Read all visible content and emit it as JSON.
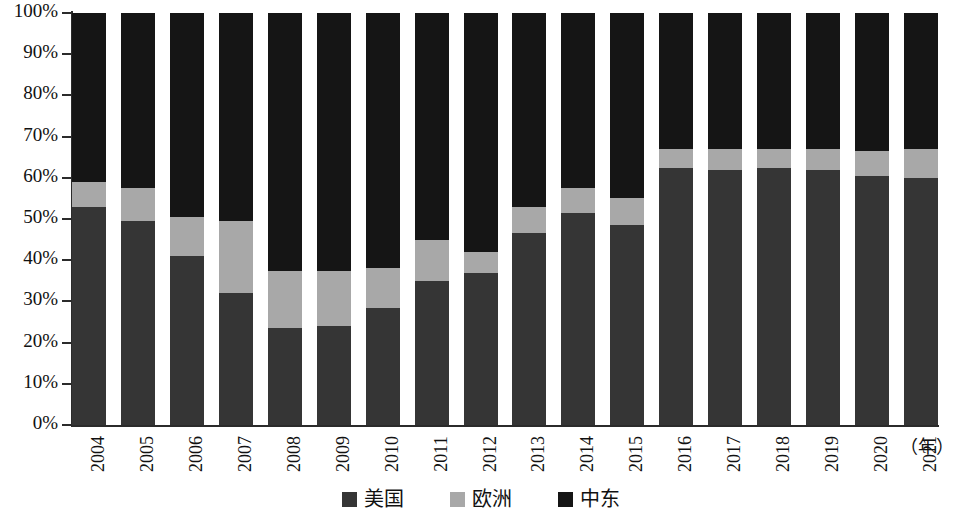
{
  "chart_data": {
    "type": "bar",
    "subtype": "stacked-100-percent",
    "title": "",
    "xlabel": "（年）",
    "ylabel": "",
    "ylim": [
      0,
      100
    ],
    "ytick_labels": [
      "100%",
      "90%",
      "80%",
      "70%",
      "60%",
      "50%",
      "40%",
      "30%",
      "20%",
      "10%",
      "0%"
    ],
    "ytick_values": [
      100,
      90,
      80,
      70,
      60,
      50,
      40,
      30,
      20,
      10,
      0
    ],
    "grid": false,
    "legend_position": "bottom-center",
    "categories": [
      "2004",
      "2005",
      "2006",
      "2007",
      "2008",
      "2009",
      "2010",
      "2011",
      "2012",
      "2013",
      "2014",
      "2015",
      "2016",
      "2017",
      "2018",
      "2019",
      "2020",
      "2021"
    ],
    "series": [
      {
        "name": "美国",
        "color": "#353535",
        "values": [
          53,
          49.5,
          41,
          32,
          23.5,
          24,
          28.5,
          35,
          37,
          46.5,
          51.5,
          48.5,
          62.5,
          62,
          62.5,
          62,
          60.5,
          60
        ]
      },
      {
        "name": "欧洲",
        "color": "#a8a8a8",
        "values": [
          6,
          8,
          9.5,
          17.5,
          14,
          13.5,
          9.5,
          10,
          5,
          6.5,
          6,
          6.5,
          4.5,
          5,
          4.5,
          5,
          6,
          7
        ]
      },
      {
        "name": "中东",
        "color": "#151515",
        "values": [
          41,
          42.5,
          49.5,
          50.5,
          62.5,
          62.5,
          62,
          55,
          58,
          47,
          42.5,
          45,
          33,
          33,
          33,
          33,
          33.5,
          33
        ]
      }
    ]
  },
  "legend": {
    "items": [
      {
        "label": "美国",
        "swatch_name": "legend-swatch-us"
      },
      {
        "label": "欧洲",
        "swatch_name": "legend-swatch-europe"
      },
      {
        "label": "中东",
        "swatch_name": "legend-swatch-middle-east"
      }
    ]
  },
  "axis": {
    "x_unit_label": "（年）"
  }
}
